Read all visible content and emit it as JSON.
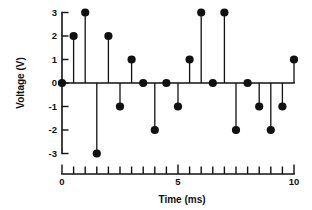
{
  "chart_data": {
    "type": "scatter",
    "plot_style": "stem",
    "title": "",
    "xlabel": "Time (ms)",
    "ylabel": "Voltage (V)",
    "xlim": [
      0,
      10
    ],
    "ylim": [
      -3,
      3
    ],
    "grid": false,
    "legend": null,
    "x_tick_labels": [
      "0",
      "5",
      "10"
    ],
    "x_tick_label_values": [
      0,
      5,
      10
    ],
    "x_minor_tick_step": 0.5,
    "y_tick_labels": [
      "3",
      "2",
      "1",
      "0",
      "-1",
      "-2",
      "-3"
    ],
    "y_tick_label_values": [
      3,
      2,
      1,
      0,
      -1,
      -2,
      -3
    ],
    "marker": "filled-circle",
    "marker_color": "#111111",
    "line_color": "#111111",
    "x": [
      0,
      0.5,
      1,
      1.5,
      2,
      2.5,
      3,
      3.5,
      4,
      4.5,
      5,
      5.5,
      6,
      6.5,
      7,
      7.5,
      8,
      8.5,
      9,
      9.5,
      10
    ],
    "values": [
      0,
      2,
      3,
      -3,
      2,
      -1,
      1,
      0,
      -2,
      0,
      -1,
      1,
      3,
      0,
      3,
      -2,
      0,
      -1,
      -2,
      -1,
      1
    ],
    "series": [
      {
        "name": "Voltage",
        "x": [
          0,
          0.5,
          1,
          1.5,
          2,
          2.5,
          3,
          3.5,
          4,
          4.5,
          5,
          5.5,
          6,
          6.5,
          7,
          7.5,
          8,
          8.5,
          9,
          9.5,
          10
        ],
        "values": [
          0,
          2,
          3,
          -3,
          2,
          -1,
          1,
          0,
          -2,
          0,
          -1,
          1,
          3,
          0,
          3,
          -2,
          0,
          -1,
          -2,
          -1,
          1
        ]
      }
    ]
  },
  "axes": {
    "y_axis_title": "Voltage (V)",
    "x_axis_title": "Time (ms)"
  }
}
